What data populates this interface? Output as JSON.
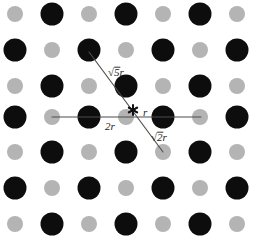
{
  "figure": {
    "background_color": "#ffffff",
    "width": 253,
    "height": 240
  },
  "lattice": {
    "description": "Checkerboard arrangement of two alternating atom types on a square grid",
    "columns": 7,
    "rows": 7,
    "x_positions": [
      15,
      52,
      89,
      126,
      163,
      200,
      237
    ],
    "y_positions": [
      14,
      50,
      86,
      117,
      152,
      188,
      224
    ],
    "spacing_px": 37,
    "species": [
      {
        "name": "dark-atom",
        "color": "#0d0d0d",
        "radius_px": 11.5,
        "parity": "odd",
        "label": "large dark circle"
      },
      {
        "name": "light-atom",
        "color": "#b4b4b4",
        "radius_px": 8.0,
        "parity": "even",
        "label": "small gray circle"
      }
    ]
  },
  "annotations": {
    "lines": [
      {
        "name": "horizontal-2r-line",
        "x1": 52,
        "y1": 117,
        "x2": 201,
        "y2": 117,
        "color": "#4d4d4d"
      },
      {
        "name": "diagonal-sqrt5r-line",
        "x1": 89,
        "y1": 52,
        "x2": 163,
        "y2": 152,
        "color": "#4d4d4d"
      }
    ],
    "labels": [
      {
        "name": "label-sqrt5r",
        "prefix": "√",
        "radicand": "5",
        "suffix": "r",
        "text": "√5r",
        "x": 108,
        "y": 76,
        "font_size": 11
      },
      {
        "name": "label-2r",
        "prefix": "",
        "radicand": "",
        "suffix": "2r",
        "text": "2r",
        "x": 105,
        "y": 130,
        "font_size": 11
      },
      {
        "name": "label-r",
        "prefix": "",
        "radicand": "",
        "suffix": "r",
        "text": "r",
        "x": 143,
        "y": 116,
        "font_size": 11
      },
      {
        "name": "label-sqrt2r",
        "prefix": "√",
        "radicand": "2",
        "suffix": "r",
        "text": "√2r",
        "x": 151,
        "y": 141,
        "font_size": 11
      }
    ],
    "star_marker": {
      "name": "star-marker",
      "glyph": "✳",
      "x": 133,
      "y": 110,
      "size_px": 11,
      "color": "#111111"
    }
  }
}
